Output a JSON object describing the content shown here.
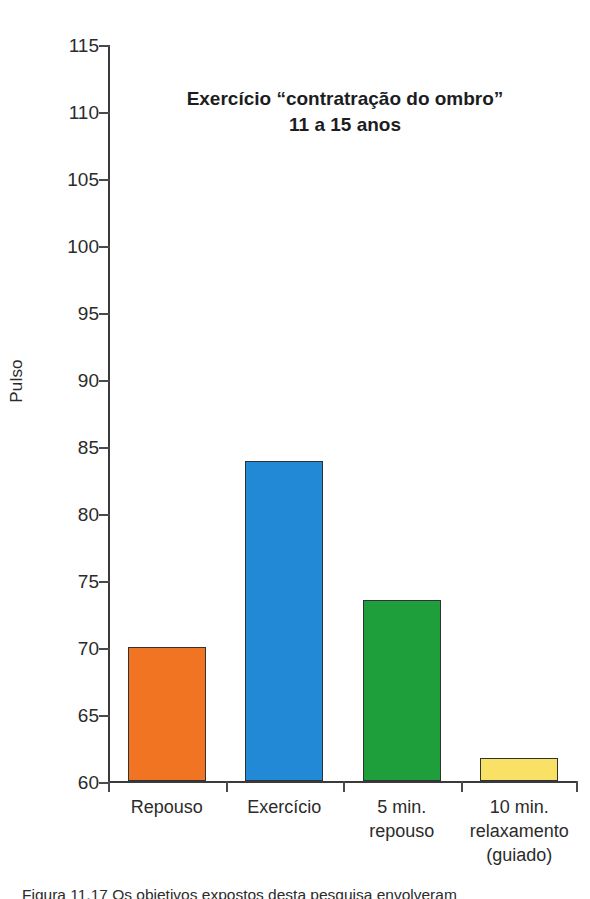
{
  "chart_data": {
    "type": "bar",
    "title_lines": [
      "Exercício “contratração do ombro”",
      "11 a 15 anos"
    ],
    "xlabel": "",
    "ylabel": "Pulso",
    "ylim": [
      60,
      115
    ],
    "ytick_step": 5,
    "yticks": [
      115,
      110,
      105,
      100,
      95,
      90,
      85,
      80,
      75,
      70,
      65,
      60
    ],
    "ytick_labels": [
      "115",
      "110",
      "105",
      "100",
      "95",
      "90",
      "85",
      "80",
      "75",
      "70",
      "65",
      "60"
    ],
    "grid": false,
    "legend": "none",
    "categories": [
      "Repouso",
      "Exercício",
      "5 min. repouso",
      "10 min. relaxamento (guiado)"
    ],
    "category_label_lines": [
      [
        "Repouso"
      ],
      [
        "Exercício"
      ],
      [
        "5 min.",
        "repouso"
      ],
      [
        "10 min.",
        "relaxamento",
        "(guiado)"
      ]
    ],
    "values": [
      70.0,
      83.9,
      73.5,
      61.7
    ],
    "bar_colors": [
      "#F07422",
      "#2189D6",
      "#1F9E3C",
      "#F8E165"
    ],
    "bar_edge_color": "#2F3338",
    "series": [
      {
        "name": "Pulso",
        "values": [
          70.0,
          83.9,
          73.5,
          61.7
        ]
      }
    ]
  },
  "caption": {
    "text": "Figura 11.17   Os objetivos expostos desta pesquisa envolveram"
  }
}
